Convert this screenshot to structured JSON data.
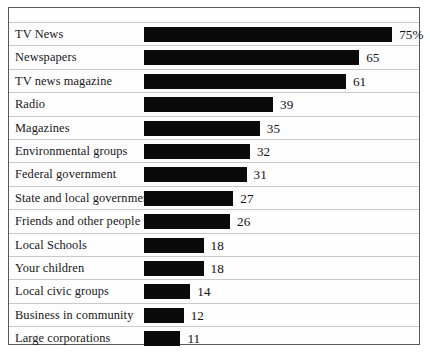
{
  "chart_data": {
    "type": "bar",
    "orientation": "horizontal",
    "title": "",
    "subtitle": "",
    "xlabel": "",
    "ylabel": "",
    "xlim": [
      0,
      80
    ],
    "grid": false,
    "legend": null,
    "value_unit": "percent",
    "categories": [
      "TV News",
      "Newspapers",
      "TV news magazine",
      "Radio",
      "Magazines",
      "Environmental groups",
      "Federal government",
      "State and local government",
      "Friends and other people",
      "Local Schools",
      "Your children",
      "Local civic groups",
      "Business in community",
      "Large corporations"
    ],
    "values": [
      75,
      65,
      61,
      39,
      35,
      32,
      31,
      27,
      26,
      18,
      18,
      14,
      12,
      11
    ],
    "value_labels": [
      "75%",
      "65",
      "61",
      "39",
      "35",
      "32",
      "31",
      "27",
      "26",
      "18",
      "18",
      "14",
      "12",
      "11"
    ],
    "bar_color": "#0a0a0a",
    "background_color": "#fdfdfd",
    "border_color": "#58585a",
    "separator_color": "#c9c9ca",
    "px_per_unit": 3.31
  }
}
